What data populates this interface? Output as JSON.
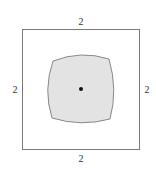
{
  "diagram": {
    "outer_square": {
      "x": 22,
      "y": 29,
      "width": 117,
      "height": 120,
      "stroke": "#7a7a7a"
    },
    "labels": {
      "top": "2",
      "bottom": "2",
      "left": "2",
      "right": "2"
    },
    "inner_region": {
      "fill": "#e3e3e3",
      "stroke": "#6e6e6e",
      "shape": "rounded square with bulging sides"
    },
    "center_point": {
      "cx": 81,
      "cy": 89,
      "r": 2,
      "color": "#111111"
    }
  }
}
